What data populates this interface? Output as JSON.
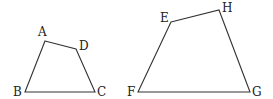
{
  "figure": {
    "stroke_color": "#333333",
    "shapes": [
      {
        "name": "ABCD",
        "vertices": [
          {
            "label": "A",
            "x": 45,
            "y": 41,
            "lx": 38,
            "ly": 36
          },
          {
            "label": "D",
            "x": 76,
            "y": 49,
            "lx": 79,
            "ly": 50
          },
          {
            "label": "C",
            "x": 95,
            "y": 92,
            "lx": 97,
            "ly": 96
          },
          {
            "label": "B",
            "x": 25,
            "y": 92,
            "lx": 13,
            "ly": 96
          }
        ]
      },
      {
        "name": "EFGH",
        "vertices": [
          {
            "label": "E",
            "x": 171,
            "y": 22,
            "lx": 160,
            "ly": 22
          },
          {
            "label": "H",
            "x": 219,
            "y": 10,
            "lx": 222,
            "ly": 12
          },
          {
            "label": "G",
            "x": 250,
            "y": 92,
            "lx": 252,
            "ly": 96
          },
          {
            "label": "F",
            "x": 138,
            "y": 92,
            "lx": 127,
            "ly": 96
          }
        ]
      }
    ]
  }
}
